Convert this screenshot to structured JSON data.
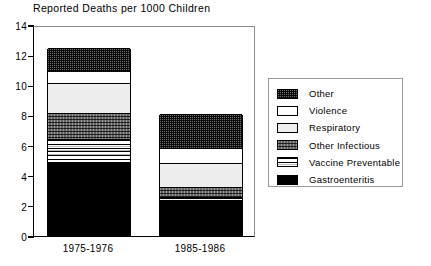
{
  "chart_data": {
    "type": "bar",
    "subtype": "stacked-vertical",
    "title": "Reported Deaths per 1000 Children",
    "xlabel": "",
    "ylabel": "",
    "ylim": [
      0,
      14
    ],
    "ytick_step": 2,
    "ytick_labels": [
      "14",
      "12",
      "10",
      "8",
      "6",
      "4",
      "2",
      "0"
    ],
    "ytick_values": [
      14,
      12,
      10,
      8,
      6,
      4,
      2,
      0
    ],
    "grid": false,
    "legend_position": "right-outside",
    "categories": [
      "1975-1976",
      "1985-1986"
    ],
    "stack_order_bottom_to_top": [
      "Gastroenteritis",
      "Vaccine Preventable",
      "Other Infectious",
      "Respiratory",
      "Violence",
      "Other"
    ],
    "series": [
      {
        "name": "Gastroenteritis",
        "swatch": "solid-black",
        "values": [
          4.85,
          2.3
        ]
      },
      {
        "name": "Vaccine Preventable",
        "swatch": "horizontal-stripes",
        "values": [
          1.55,
          0.25
        ]
      },
      {
        "name": "Other Infectious",
        "swatch": "medium-checker",
        "values": [
          1.7,
          0.65
        ]
      },
      {
        "name": "Respiratory",
        "swatch": "light-gray",
        "values": [
          2.0,
          1.6
        ]
      },
      {
        "name": "Violence",
        "swatch": "white",
        "values": [
          0.8,
          1.0
        ]
      },
      {
        "name": "Other",
        "swatch": "dark-checker",
        "values": [
          1.5,
          2.25
        ]
      }
    ],
    "totals": [
      12.4,
      8.05
    ],
    "annotations": []
  },
  "legend": {
    "entries": [
      {
        "label": "Other",
        "swatch": "dark-checker"
      },
      {
        "label": "Violence",
        "swatch": "white"
      },
      {
        "label": "Respiratory",
        "swatch": "light-gray"
      },
      {
        "label": "Other Infectious",
        "swatch": "medium-checker"
      },
      {
        "label": "Vaccine Preventable",
        "swatch": "horizontal-stripes"
      },
      {
        "label": "Gastroenteritis",
        "swatch": "solid-black"
      }
    ]
  },
  "colors": {
    "axis": "#000000",
    "frame_light": "#8a8a8a",
    "background": "#ffffff",
    "dark_checker": "#6b6b6b",
    "medium_checker": "#9a9a9a",
    "light_gray": "#ededed",
    "white": "#ffffff",
    "black": "#000000"
  }
}
